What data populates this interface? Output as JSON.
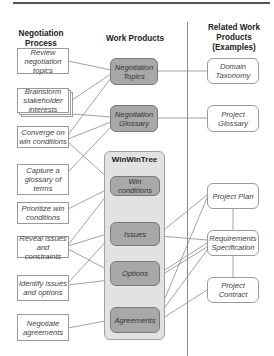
{
  "headers": {
    "process": "Negotiation Process",
    "work_products": "Work Products",
    "related": "Related Work Products (Examples)"
  },
  "process_steps": [
    {
      "label": "Review negotiation topics"
    },
    {
      "label": "Brainstorm stakeholder interests"
    },
    {
      "label": "Converge on win conditions"
    },
    {
      "label": "Capture a glossary of terms"
    },
    {
      "label": "Prioritize win conditions"
    },
    {
      "label": "Reveal issues and constraints"
    },
    {
      "label": "Identify issues and options"
    },
    {
      "label": "Negotiate agreements"
    }
  ],
  "work_products": {
    "topics": "Negotiation Topics",
    "glossary": "Negotiation Glossary",
    "tree_title": "WinWinTree",
    "win_conditions": "Win conditions",
    "issues": "Issues",
    "options": "Options",
    "agreements": "Agreements"
  },
  "related_products": {
    "domain_taxonomy": "Domain Taxonomy",
    "project_glossary": "Project Glossary",
    "project_plan": "Project Plan",
    "requirements_spec": "Requirements Specification",
    "project_contract": "Project Contract"
  },
  "colors": {
    "work_product_fill": "#a8a8a8",
    "tree_fill": "#e2e2e2",
    "line": "#8a8a8a"
  }
}
